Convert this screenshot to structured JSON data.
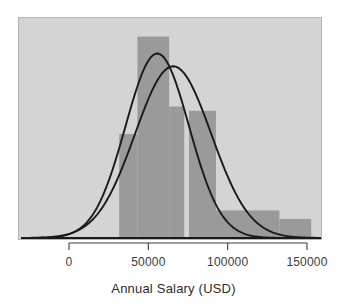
{
  "chart_data": {
    "type": "bar",
    "title": "",
    "subtitle": "",
    "xlabel": "Annual Salary (USD)",
    "ylabel": "",
    "xlim": [
      -25000,
      160000
    ],
    "ylim": [
      0,
      1.05
    ],
    "grid": false,
    "legend": null,
    "xticks": [
      0,
      50000,
      100000,
      150000
    ],
    "xticklabels": [
      "0",
      "50000",
      "100000",
      "150000"
    ],
    "bar_color": "#9a9a9a",
    "panel_color": "#d4d4d4",
    "curve_color": "#1a1a1a",
    "axis_color": "#3b3b3b",
    "bins": [
      {
        "x0": 31000,
        "x1": 42500,
        "height": 0.49
      },
      {
        "x0": 42500,
        "x1": 62500,
        "height": 0.95
      },
      {
        "x0": 62500,
        "x1": 72000,
        "height": 0.62
      },
      {
        "x0": 75000,
        "x1": 92000,
        "height": 0.6
      },
      {
        "x0": 92000,
        "x1": 132000,
        "height": 0.13
      },
      {
        "x0": 132000,
        "x1": 152000,
        "height": 0.09
      }
    ],
    "series": [
      {
        "name": "density-curve-1",
        "type": "line",
        "mean": 55000,
        "sd": 20000,
        "peak_height": 0.87
      },
      {
        "name": "density-curve-2",
        "type": "line",
        "mean": 65000,
        "sd": 24000,
        "peak_height": 0.81
      }
    ],
    "baseline": 0
  }
}
